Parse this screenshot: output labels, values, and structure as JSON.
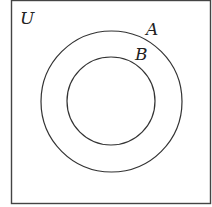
{
  "diagram": {
    "type": "venn",
    "universe_label": "U",
    "sets": [
      {
        "label": "A",
        "contains": "B"
      },
      {
        "label": "B",
        "subset_of": "A"
      }
    ],
    "colors": {
      "stroke": "#333333",
      "background": "#ffffff"
    }
  }
}
